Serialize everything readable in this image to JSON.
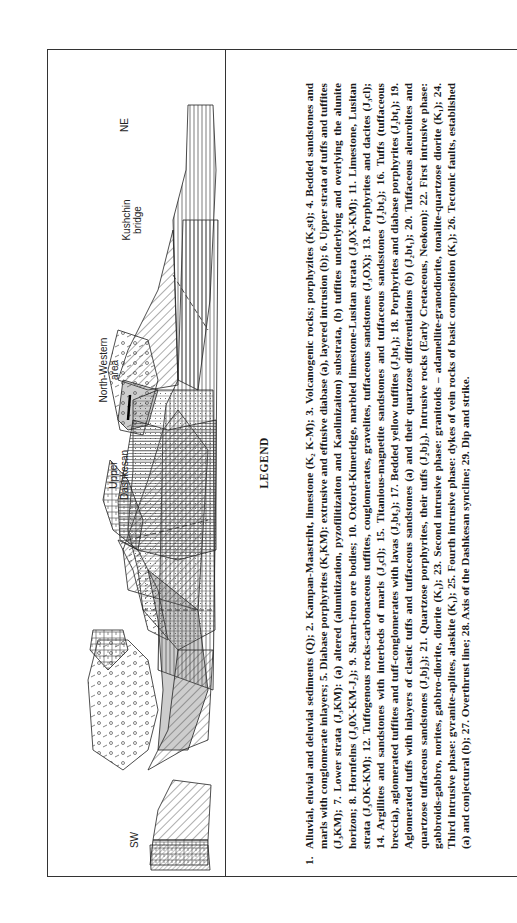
{
  "figure": {
    "direction_labels": {
      "left": "SW",
      "right": "NE"
    },
    "place_labels": [
      {
        "id": "upper-dashkesan",
        "lines": [
          "Upper",
          "Dashkesan"
        ]
      },
      {
        "id": "north-western-area",
        "lines": [
          "North-Western",
          "area"
        ]
      },
      {
        "id": "kushchin-bridge",
        "lines": [
          "Kushchin",
          "bridge"
        ]
      }
    ],
    "orientation": "rotated 90° counter-clockwise"
  },
  "legend": {
    "title": "LEGEND",
    "first_number": "1.",
    "text": "Alluvial, eluvial and deluvial sediments (Q); 2. Kampan-Maastriht, limestone (K₂ K-M); 3. Volcanogenic rocks; porphyzites (K₂st); 4. Bedded sandstones and marls with conglomerate inlayers; 5. Diabase porphyrites (K₁KM): extrusive and effusive diabase (a), layered intrusion (b); 6. Upper strata of tuffs and tuffites (J₃KM); 7. Lower strata (J₃KM): (a) altered (alumitization, pyzofilitizaiton and Kaolinizaiton) substrata, (b) tuffites underlying and overlying the alunite horizon; 8. Hornfelns (J₃0X-KM-J₂); 9. Skarn-iron ore bodies; 10. Oxford-Kimeridge, marbled limestone-Lusitan strata (J₃0X-KM); 11. Limestone, Lusitan strata (J₃OK-KM); 12. Tuffogenous rocks-carbonaceous tuffites, couglomerates, gravelites, tuffaceous sandstones (J₃OX); 13. Porphyrites and dacites (J₃cl); 14. Argillites and sandstones with interbeds of marls (J₃cl); 15. Titanious-magnetite sandstones and tuffaceous sandsstones (J₂bt₂); 16. Tuffs (tuffaceous breccia), aglomerated tuffites and tuff-conglomerates with lavas (J₂bt₂); 17. Bedded yellow tuffites (J₂bt₁); 18. Porphyrites and diabase porphyrites (J₂bt₁); 19. Aglomerated tuffs with inlayers of clastic tuffs and tuffaceous sandstones (a) and their quartzose differentiations (b) (J₂bt₁); 20. Tuffaceous aleurolites and quartzose tuffaceous sandstones (J₂bj₂); 21. Quartzose porphyrites, their tuffs (J₂bj₂). Intrusive rocks (Early Cretaceous, Neokom): 22. First intrusive phase: gabbroids-gabbro, norites, gabbro-diorite, diorite (K₁); 23. Second intrusive phase: granitoids – adamellite-granodiorite, tonalite-quartzose diorite (K₁); 24. Third intrusive phase: gvranite-aplites, alaskite (K₁); 25. Fourth intrusive phase: dykes of vein rocks of basic composition (K₁); 26. Tectonic faults, established (a) and conjectural (b); 27. Overthrust line; 28. Axis of the Dashkesan syncline; 29. Dip and strike."
  }
}
